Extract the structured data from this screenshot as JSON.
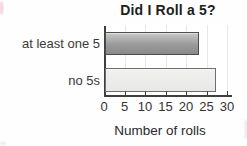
{
  "chart_data": {
    "type": "bar",
    "orientation": "horizontal",
    "title": "Did I Roll a 5?",
    "xlabel": "Number of rolls",
    "categories": [
      "at least one 5",
      "no 5s"
    ],
    "values": [
      23,
      27
    ],
    "xlim": [
      0,
      30
    ],
    "xticks": [
      0,
      5,
      10,
      15,
      20,
      25,
      30
    ],
    "grid": true,
    "legend": false,
    "bar_styles": [
      {
        "name": "dark-gray-gradient",
        "fill_top": "#c9c9c9",
        "fill_mid": "#9a9a9a",
        "fill_bottom": "#8a8a8a",
        "border": "#4d4d4d"
      },
      {
        "name": "light-gray",
        "fill_top": "#f1f1ef",
        "fill_mid": "#ececea",
        "fill_bottom": "#e7e7e5",
        "border": "#6e6e6e"
      }
    ]
  },
  "colors": {
    "axis": "#3f3f3f",
    "gridline": "#e7e7ed",
    "title_text": "#1d1d1d",
    "label_text": "#3a3a3a",
    "background": "#fefefe",
    "scan_artifact": "#e48fae"
  }
}
